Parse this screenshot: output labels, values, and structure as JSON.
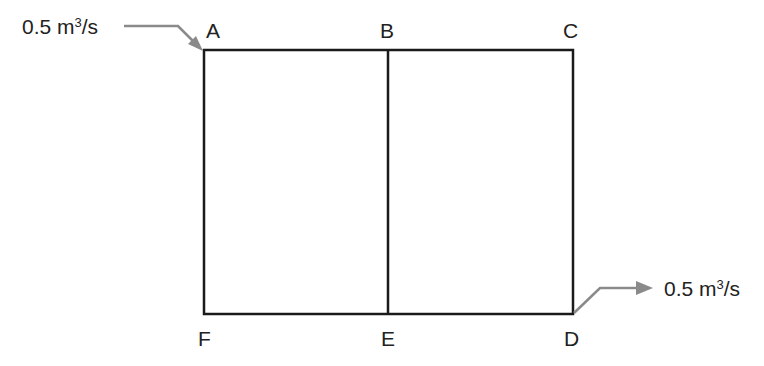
{
  "diagram": {
    "type": "pipe network",
    "nodes": [
      {
        "id": "A",
        "label": "A"
      },
      {
        "id": "B",
        "label": "B"
      },
      {
        "id": "C",
        "label": "C"
      },
      {
        "id": "D",
        "label": "D"
      },
      {
        "id": "E",
        "label": "E"
      },
      {
        "id": "F",
        "label": "F"
      }
    ],
    "edges": [
      [
        "A",
        "B"
      ],
      [
        "B",
        "C"
      ],
      [
        "C",
        "D"
      ],
      [
        "D",
        "E"
      ],
      [
        "E",
        "F"
      ],
      [
        "F",
        "A"
      ],
      [
        "B",
        "E"
      ]
    ],
    "inflow": {
      "node": "A",
      "value": "0.5",
      "unit_base": " m",
      "unit_exp": "3",
      "unit_tail": "/s"
    },
    "outflow": {
      "node": "D",
      "value": "0.5",
      "unit_base": " m",
      "unit_exp": "3",
      "unit_tail": "/s"
    },
    "colors": {
      "pipe": "#1a1a1a",
      "arrow": "#8a8a8a"
    }
  }
}
